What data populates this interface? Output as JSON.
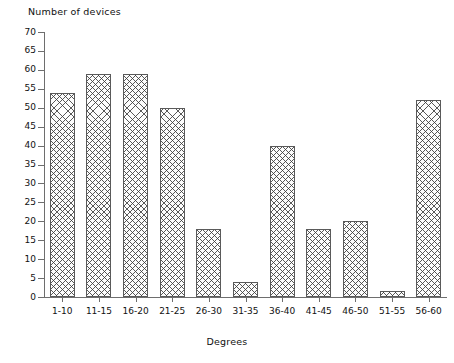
{
  "chart_data": {
    "type": "bar",
    "title": "",
    "ylabel": "Number of devices",
    "xlabel": "Degrees",
    "categories": [
      "1-10",
      "11-15",
      "16-20",
      "21-25",
      "26-30",
      "31-35",
      "36-40",
      "41-45",
      "46-50",
      "51-55",
      "56-60"
    ],
    "values": [
      54,
      59,
      59,
      50,
      18,
      4,
      40,
      18,
      20,
      1.5,
      52
    ],
    "ylim": [
      0,
      70
    ],
    "ytick_labels": [
      "0",
      "5",
      "10",
      "15",
      "20",
      "25",
      "30",
      "35",
      "40",
      "45",
      "50",
      "55",
      "60",
      "65",
      "70"
    ],
    "ytick_values": [
      0,
      5,
      10,
      15,
      20,
      25,
      30,
      35,
      40,
      45,
      50,
      55,
      60,
      65,
      70
    ],
    "grid": false,
    "legend": null,
    "bar_style": "cross-hatched",
    "colors": {
      "axis": "#6e6e6e",
      "bar_edge": "#5a5a5a",
      "bar_fill": "#fdfdfd",
      "hatch": "#3c3c3c",
      "text": "#111111",
      "background": "#ffffff"
    }
  }
}
